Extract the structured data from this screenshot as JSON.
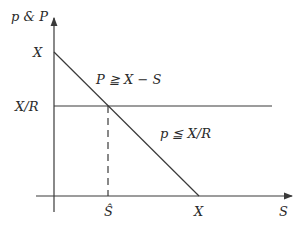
{
  "diagram": {
    "y_axis_label": "p & P",
    "x_axis_label": "S",
    "y_ticks": {
      "top": "X",
      "mid": "X/R"
    },
    "x_ticks": {
      "s_hat": "Ŝ",
      "x": "X"
    },
    "annotations": {
      "upper": "P ≧ X − S",
      "lower": "p ≦ X/R"
    },
    "colors": {
      "line": "#3a3a3a",
      "text": "#2a2a2a"
    }
  }
}
